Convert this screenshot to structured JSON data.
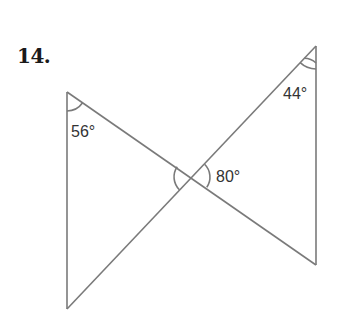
{
  "problem": {
    "number": "14."
  },
  "diagram": {
    "stroke_color": "#7a7a7a",
    "vertices": {
      "left_top": [
        67,
        92
      ],
      "left_bottom": [
        67,
        309
      ],
      "right_top": [
        316,
        46
      ],
      "right_bottom": [
        316,
        265
      ],
      "intersection": [
        192,
        177
      ]
    },
    "angles": [
      {
        "id": "left-top-angle",
        "label": "56°",
        "marks": 1
      },
      {
        "id": "right-top-angle",
        "label": "44°",
        "marks": 2
      },
      {
        "id": "vertical-angle-right",
        "label": "80°",
        "marks": 1
      },
      {
        "id": "vertical-angle-left",
        "label": "",
        "marks": 1
      }
    ]
  }
}
